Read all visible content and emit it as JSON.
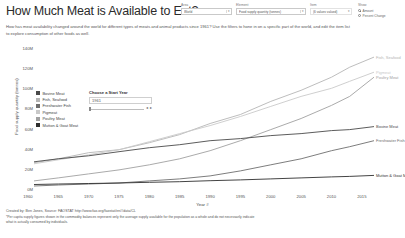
{
  "header": {
    "title": "How Much Meat is Available to Eat?",
    "subtitle": "How has meat availability changed around the world for different types of meats and animal products since 1961? Use the filters to hone in on a specific part of the world, and edit the item list to explore consumption of other foods as well.",
    "controls": [
      {
        "label": "Area",
        "value": "World"
      },
      {
        "label": "Element",
        "value": "Food supply quantity (tonnes)"
      },
      {
        "label": "Item",
        "value": "(6 values valued)"
      }
    ],
    "show": {
      "label": "Show",
      "options": [
        {
          "label": "Amount",
          "selected": true
        },
        {
          "label": "Percent Change",
          "selected": false
        }
      ]
    }
  },
  "start_year": {
    "title": "Choose a Start Year",
    "value": "1961",
    "decrement": "◂",
    "increment": "▸"
  },
  "legend": {
    "items": [
      {
        "label": "Bovine Meat",
        "color": "#4a4a4a"
      },
      {
        "label": "Fish, Seafood",
        "color": "#b5b5b5"
      },
      {
        "label": "Freshwater Fish",
        "color": "#6e6e6e"
      },
      {
        "label": "Pigmeat",
        "color": "#c9c9c9"
      },
      {
        "label": "Poultry Meat",
        "color": "#a0a0a0"
      },
      {
        "label": "Mutton & Goat Meat",
        "color": "#2f2f2f"
      }
    ]
  },
  "chart_data": {
    "type": "line",
    "title": "How Much Meat is Available to Eat?",
    "xlabel": "Year #",
    "ylabel": "Food supply quantity (tonnes)",
    "grid": false,
    "legend_position": "top-left",
    "xlim": [
      1961,
      2017
    ],
    "ylim": [
      0,
      145000000
    ],
    "xticks": [
      1960,
      1965,
      1970,
      1975,
      1980,
      1985,
      1990,
      1995,
      2000,
      2005,
      2010,
      2015
    ],
    "yticks": [
      0,
      20000000,
      40000000,
      60000000,
      80000000,
      100000000,
      120000000,
      140000000
    ],
    "ytick_labels": [
      "0M",
      "20M",
      "40M",
      "60M",
      "80M",
      "100M",
      "120M",
      "140M"
    ],
    "x": [
      1961,
      1965,
      1970,
      1975,
      1980,
      1985,
      1990,
      1995,
      2000,
      2005,
      2010,
      2013,
      2017
    ],
    "series": [
      {
        "name": "Fish, Seafood",
        "color": "#b5b5b5",
        "end_label": "Fish, Seafood",
        "values": [
          27000000,
          31000000,
          37000000,
          40000000,
          47000000,
          55000000,
          66000000,
          75000000,
          88000000,
          99000000,
          112000000,
          122000000,
          132000000
        ]
      },
      {
        "name": "Pigmeat",
        "color": "#c9c9c9",
        "end_label": "Pigmeat",
        "values": [
          26000000,
          30000000,
          35000000,
          40000000,
          48000000,
          56000000,
          64000000,
          73000000,
          83000000,
          93000000,
          101000000,
          108000000,
          117000000
        ]
      },
      {
        "name": "Poultry Meat",
        "color": "#a0a0a0",
        "end_label": "Poultry Meat",
        "values": [
          9000000,
          12000000,
          16000000,
          20000000,
          25000000,
          31000000,
          39000000,
          49000000,
          60000000,
          71000000,
          84000000,
          93000000,
          112000000
        ]
      },
      {
        "name": "Bovine Meat",
        "color": "#4a4a4a",
        "end_label": "Bovine Meat",
        "values": [
          28000000,
          31000000,
          34000000,
          38000000,
          42000000,
          45000000,
          49000000,
          51000000,
          54000000,
          56000000,
          59000000,
          60000000,
          63000000
        ]
      },
      {
        "name": "Freshwater Fish",
        "color": "#6e6e6e",
        "end_label": "Freshwater Fish",
        "values": [
          4000000,
          5000000,
          6000000,
          7000000,
          9000000,
          11000000,
          14000000,
          19000000,
          25000000,
          31000000,
          39000000,
          43000000,
          49000000
        ]
      },
      {
        "name": "Mutton & Goat Meat",
        "color": "#2f2f2f",
        "end_label": "Mutton & Goat Meat",
        "values": [
          5500000,
          6000000,
          6500000,
          7000000,
          7600000,
          8200000,
          9200000,
          10000000,
          11000000,
          12000000,
          13000000,
          13500000,
          14500000
        ]
      }
    ]
  },
  "footer": {
    "credit": "Created by: Ben Jones, Source: FAOSTAT http://www.fao.org/faostat/en/#data/CL",
    "note_line1": "*Per capita supply figures shown in the commodity balances represent only the average supply available for the population as a whole and do not necessarily indicate",
    "note_line2": "what is actually consumed by individuals."
  }
}
